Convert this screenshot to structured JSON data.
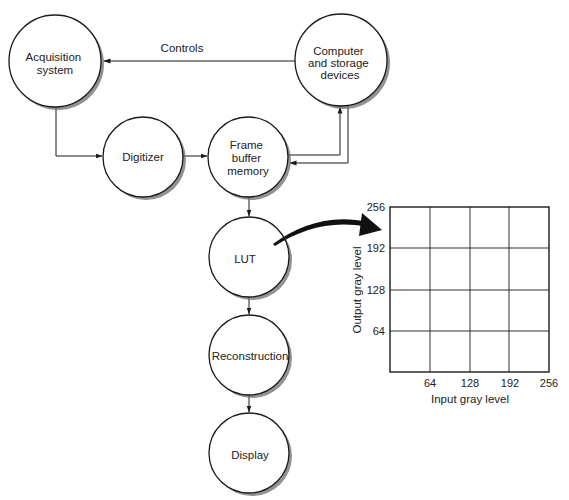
{
  "diagram": {
    "title": "",
    "nodes": [
      {
        "id": "acquisition",
        "lines": [
          "Acquisition",
          "system"
        ],
        "cx": 55,
        "cy": 61,
        "r": 46
      },
      {
        "id": "computer",
        "lines": [
          "Computer",
          "and storage",
          "devices"
        ],
        "cx": 341,
        "cy": 60,
        "r": 46
      },
      {
        "id": "digitizer",
        "lines": [
          "Digitizer"
        ],
        "cx": 143,
        "cy": 157,
        "r": 40
      },
      {
        "id": "frame-buffer",
        "lines": [
          "Frame",
          "buffer",
          "memory"
        ],
        "cx": 248,
        "cy": 157,
        "r": 40
      },
      {
        "id": "lut",
        "lines": [
          "LUT"
        ],
        "cx": 249,
        "cy": 257,
        "r": 40
      },
      {
        "id": "reconstruction",
        "lines": [
          "Reconstruction"
        ],
        "cx": 249,
        "cy": 355,
        "r": 40
      },
      {
        "id": "display",
        "lines": [
          "Display"
        ],
        "cx": 249,
        "cy": 453,
        "r": 40
      }
    ],
    "edges": [
      {
        "from": "computer",
        "to": "acquisition",
        "label": "Controls"
      },
      {
        "from": "acquisition",
        "to": "digitizer",
        "label": ""
      },
      {
        "from": "digitizer",
        "to": "frame-buffer",
        "label": ""
      },
      {
        "from": "frame-buffer",
        "to": "computer",
        "label": ""
      },
      {
        "from": "computer",
        "to": "frame-buffer",
        "label": ""
      },
      {
        "from": "frame-buffer",
        "to": "lut",
        "label": ""
      },
      {
        "from": "lut",
        "to": "reconstruction",
        "label": ""
      },
      {
        "from": "reconstruction",
        "to": "display",
        "label": ""
      },
      {
        "from": "lut",
        "to": "lut-graph",
        "label": "",
        "style": "curved-bold"
      }
    ],
    "labels": {
      "controls": "Controls"
    },
    "colors": {
      "stroke": "#1a1a1a",
      "shadow": "#6e6e6e",
      "fill": "#ffffff",
      "text": "#222222"
    }
  },
  "lut_graph": {
    "x_axis_label": "Input gray level",
    "y_axis_label": "Output gray level",
    "x_ticks": [
      "64",
      "128",
      "192",
      "256"
    ],
    "y_ticks": [
      "256",
      "192",
      "128",
      "64"
    ],
    "x_range": [
      0,
      256
    ],
    "y_range": [
      0,
      256
    ],
    "grid": true
  }
}
